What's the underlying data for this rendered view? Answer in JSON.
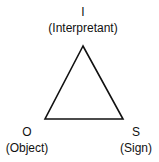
{
  "diagram": {
    "nodes": [
      {
        "id": "I",
        "letter": "I",
        "label": "(Interpretant)"
      },
      {
        "id": "O",
        "letter": "O",
        "label": "(Object)"
      },
      {
        "id": "S",
        "letter": "S",
        "label": "(Sign)"
      }
    ],
    "edges": [
      [
        "I",
        "O"
      ],
      [
        "O",
        "S"
      ],
      [
        "S",
        "I"
      ]
    ],
    "colors": {
      "stroke": "#111111",
      "background": "#ffffff"
    }
  }
}
